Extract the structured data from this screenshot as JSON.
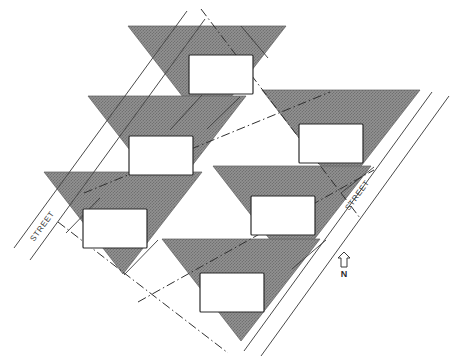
{
  "diagram": {
    "type": "site-plan",
    "canvas": {
      "width": 463,
      "height": 363
    },
    "colors": {
      "lot_fill": "#8a8a8a",
      "lot_hatch": "#6f6f6f",
      "line": "#3a3a3a",
      "building_fill": "#ffffff",
      "building_stroke": "#2b2b2b",
      "background": "#ffffff",
      "text": "#3a3a3a"
    },
    "labels": {
      "street_left": "STREET",
      "street_right": "STREET",
      "north": "N"
    },
    "lots": [
      {
        "id": "lot-1",
        "name": "lot-top-center",
        "triangle": [
          [
            128,
            26
          ],
          [
            286,
            26
          ],
          [
            207,
            128
          ]
        ],
        "building": [
          189,
          55,
          64,
          39
        ]
      },
      {
        "id": "lot-2",
        "name": "lot-upper-left",
        "triangle": [
          [
            88,
            96
          ],
          [
            246,
            96
          ],
          [
            167,
            198
          ]
        ],
        "building": [
          129,
          136,
          64,
          39
        ]
      },
      {
        "id": "lot-3",
        "name": "lot-upper-right",
        "triangle": [
          [
            262,
            90
          ],
          [
            420,
            90
          ],
          [
            341,
            192
          ]
        ],
        "building": [
          299,
          124,
          64,
          39
        ]
      },
      {
        "id": "lot-4",
        "name": "lot-lower-left",
        "triangle": [
          [
            44,
            172
          ],
          [
            202,
            172
          ],
          [
            123,
            274
          ]
        ],
        "building": [
          83,
          209,
          64,
          39
        ]
      },
      {
        "id": "lot-5",
        "name": "lot-middle-right",
        "triangle": [
          [
            213,
            166
          ],
          [
            371,
            166
          ],
          [
            292,
            268
          ]
        ],
        "building": [
          251,
          196,
          64,
          39
        ]
      },
      {
        "id": "lot-6",
        "name": "lot-bottom-center",
        "triangle": [
          [
            162,
            239
          ],
          [
            320,
            239
          ],
          [
            241,
            341
          ]
        ],
        "building": [
          200,
          273,
          64,
          39
        ]
      }
    ],
    "streets": [
      {
        "id": "street-left-edge-a",
        "name": "street-left-line-outer",
        "from": [
          14,
          248
        ],
        "to": [
          187,
          11
        ]
      },
      {
        "id": "street-left-edge-b",
        "name": "street-left-line-inner",
        "from": [
          28,
          259
        ],
        "to": [
          203,
          18
        ]
      },
      {
        "id": "street-right-edge-a",
        "name": "street-right-line-inner",
        "from": [
          244,
          349
        ],
        "to": [
          430,
          92
        ]
      },
      {
        "id": "street-right-edge-b",
        "name": "street-right-line-outer",
        "from": [
          259,
          354
        ],
        "to": [
          447,
          96
        ]
      }
    ],
    "boundaries": [
      {
        "id": "bnd-1",
        "name": "parcel-boundary-nw-se-upper",
        "from": [
          201,
          9
        ],
        "to": [
          358,
          215
        ]
      },
      {
        "id": "bnd-2",
        "name": "parcel-boundary-nw-se-lower",
        "from": [
          60,
          224
        ],
        "to": [
          226,
          351
        ]
      },
      {
        "id": "bnd-3",
        "name": "parcel-boundary-ne-sw-upper",
        "from": [
          86,
          191
        ],
        "to": [
          327,
          93
        ]
      },
      {
        "id": "bnd-4",
        "name": "parcel-boundary-ne-sw-lower",
        "from": [
          140,
          300
        ],
        "to": [
          372,
          172
        ]
      }
    ],
    "lot_lines": [
      {
        "id": "ll-1",
        "name": "lot-line-1",
        "from": [
          170,
          130
        ],
        "to": [
          202,
          95
        ]
      },
      {
        "id": "ll-2",
        "name": "lot-line-2",
        "from": [
          241,
          26
        ],
        "to": [
          268,
          58
        ]
      },
      {
        "id": "ll-3",
        "name": "lot-line-3",
        "from": [
          66,
          233
        ],
        "to": [
          100,
          198
        ]
      },
      {
        "id": "ll-4",
        "name": "lot-line-4",
        "from": [
          124,
          275
        ],
        "to": [
          158,
          240
        ]
      },
      {
        "id": "ll-5",
        "name": "lot-line-5",
        "from": [
          341,
          193
        ],
        "to": [
          374,
          167
        ]
      },
      {
        "id": "ll-6",
        "name": "lot-line-6",
        "from": [
          292,
          269
        ],
        "to": [
          326,
          240
        ]
      }
    ],
    "north_arrow": {
      "x": 344,
      "y": 254,
      "label": "N"
    }
  }
}
